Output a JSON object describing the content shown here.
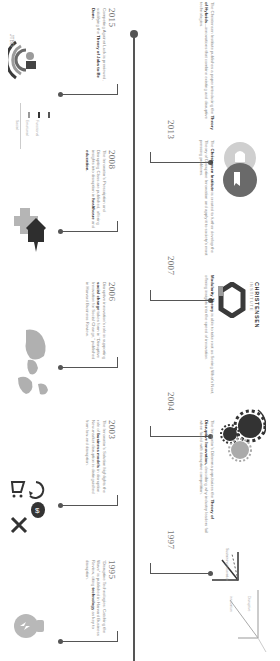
{
  "timeline": {
    "accent_dark": "#3a3a3a",
    "accent_gray": "#9b9b9b",
    "line_color": "#555555",
    "events": [
      {
        "year": "1995",
        "side": "left",
        "text_pre": "“Disruptive Technologies: Catching the Wave” is published in Harvard Business Review, citing ",
        "text_bold": "technology",
        "text_post": " as key to disruption.",
        "icon": "lightbulb-icon"
      },
      {
        "year": "1997",
        "side": "right",
        "text_pre": "The Innovator’s Dilemma popularizes the ",
        "text_bold": "Theory of Disruptive Innovation,",
        "text_post": " describing why industry leaders fail when faced with disruptive competition.",
        "icon": "disruption-chart-icon",
        "chart_labels": [
          "Sustaining innovation",
          "Disruptive innovation"
        ]
      },
      {
        "year": "2003",
        "side": "left",
        "text_pre": "The Innovator’s Solution highlights the role of ",
        "text_bold": "business models",
        "text_post": " in disruption. New-market disruption is distinguished from low-end disruption.",
        "icon": "business-model-icons"
      },
      {
        "year": "2004",
        "side": "right",
        "text_pre": "",
        "text_bold": "Modularity Theory",
        "text_post": " is able to take root as Seeing What’s Next, offering insights into the speed of innovation.",
        "icon": "gears-icon"
      },
      {
        "year": "2006",
        "side": "left",
        "text_pre": "Disruptive innovation’s role in supporting ",
        "text_bold": "social change",
        "text_post": " takes form in “Disruptive Innovation for Social Change,” published in Harvard Business Review.",
        "icon": "world-map-icon"
      },
      {
        "year": "2007",
        "side": "right",
        "text_pre": "The ",
        "text_bold": "Christensen Institute",
        "text_post": " is created to further develop the Theory of Disruptive Innovation and apply it to society’s most pressing problems.",
        "icon": "christensen-institute-logo",
        "logo_text": "CHRISTENSEN",
        "logo_sub": "INSTITUTE"
      },
      {
        "year": "2008",
        "side": "left",
        "text_pre": "The Innovator’s Prescription and Disrupting Class are published, offering insights into disruption in ",
        "text_bold": "healthcare",
        "text_mid": " and ",
        "text_bold2": "education.",
        "icon": "healthcare-education-icon"
      },
      {
        "year": "2013",
        "side": "right",
        "text_pre": "The Christensen Institute publishes a paper introducing the ",
        "text_bold": "Theory of Hybrids",
        "text_post": "—innovations that combine existing and disruptive technologies.",
        "icon": "hybrid-icon"
      },
      {
        "year": "2015",
        "side": "left",
        "text_pre": "Competing Against Luck is previewed, solidifying the ",
        "text_bold": "Theory of Jobs to Be Done.",
        "text_post": "",
        "icon": "jobs-to-be-done-icon",
        "badge": "JTBD",
        "legend": [
          "Social",
          "Emotional",
          "Functional"
        ]
      }
    ]
  }
}
